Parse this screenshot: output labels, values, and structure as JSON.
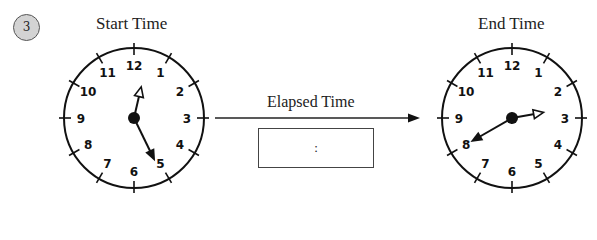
{
  "problem_number": "3",
  "start_clock": {
    "title": "Start Time",
    "hour_hand_angle_deg": 13,
    "minute_hand_angle_deg": 154,
    "numbers": [
      "12",
      "1",
      "2",
      "3",
      "4",
      "5",
      "6",
      "7",
      "8",
      "9",
      "10",
      "11"
    ]
  },
  "end_clock": {
    "title": "End Time",
    "hour_hand_angle_deg": 80,
    "minute_hand_angle_deg": 240,
    "numbers": [
      "12",
      "1",
      "2",
      "3",
      "4",
      "5",
      "6",
      "7",
      "8",
      "9",
      "10",
      "11"
    ]
  },
  "elapsed": {
    "label": "Elapsed Time",
    "answer_placeholder": ":"
  },
  "colors": {
    "badge_fill": "#d3d3d3",
    "ink": "#111111"
  }
}
